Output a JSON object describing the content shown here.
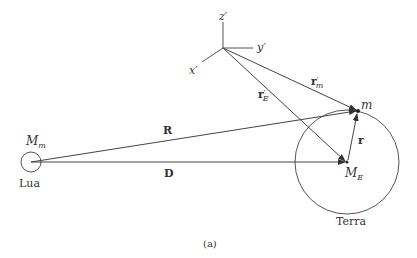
{
  "figure": {
    "caption": "(a)",
    "axes": {
      "z": "z",
      "y": "y",
      "x": "x",
      "prime": "′"
    },
    "bodies": {
      "moon": {
        "mass_label": "M",
        "mass_sub": "m",
        "name": "Lua"
      },
      "earth": {
        "mass_label": "M",
        "mass_sub": "E",
        "name": "Terra"
      },
      "particle": {
        "label": "m"
      }
    },
    "vectors": {
      "R": "R",
      "D": "D",
      "r": "r",
      "rE_prime": {
        "base": "r",
        "sup": "′",
        "sub": "E"
      },
      "rm_prime": {
        "base": "r",
        "sup": "′",
        "sub": "m"
      }
    },
    "colors": {
      "line": "#444444",
      "text": "#333333"
    }
  }
}
